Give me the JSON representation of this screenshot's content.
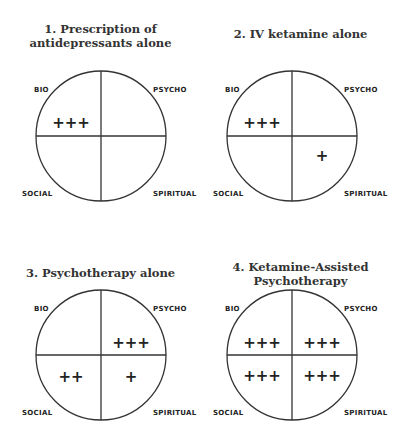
{
  "quadrant_labels": {
    "tl": "BIO",
    "tr": "PSYCHO",
    "bl": "SOCIAL",
    "br": "SPIRITUAL"
  },
  "panels": [
    {
      "title_line1": "1. Prescription of",
      "title_line2": "antidepressants alone",
      "bio": "+++",
      "psycho": "",
      "social": "",
      "spiritual": ""
    },
    {
      "title_line1": "2. IV ketamine alone",
      "title_line2": "",
      "bio": "+++",
      "psycho": "",
      "social": "",
      "spiritual": "+"
    },
    {
      "title_line1": "3. Psychotherapy alone",
      "title_line2": "",
      "bio": "",
      "psycho": "+++",
      "social": "++",
      "spiritual": "+"
    },
    {
      "title_line1": "4. Ketamine-Assisted",
      "title_line2": "Psychotherapy",
      "bio": "+++",
      "psycho": "+++",
      "social": "+++",
      "spiritual": "+++"
    }
  ]
}
